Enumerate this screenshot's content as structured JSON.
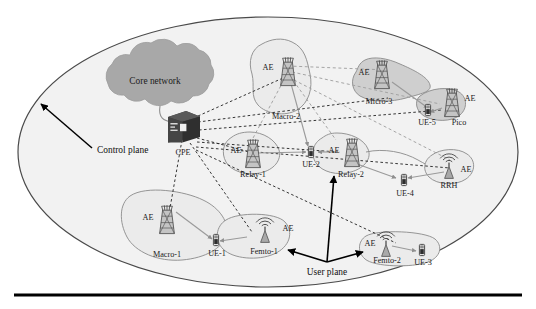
{
  "figure": {
    "colors": {
      "plane_fill": "#f2f2f2",
      "plane_stroke": "#4a4a4a",
      "cloud_fill": "#a8a8a8",
      "cloud_stroke": "#9a9a9a",
      "cell_fill": "#ebebeb",
      "cell_stroke": "#8a8a8a",
      "cell_fill_dark": "#cfcfcf",
      "cpe_fill": "#3c3c3c",
      "tower_fill": "#bdbdbd",
      "tower_stroke": "#555555",
      "link_solid": "#9a9a9a",
      "link_dashed": "#2b2b2b",
      "arrow_black": "#000000",
      "rule": "#000000"
    },
    "cloud": {
      "label": "Core network"
    },
    "cpe": {
      "label": "CPE",
      "icon": "server-box-icon"
    },
    "annotations": [
      {
        "id": "control-plane",
        "label": "Control plane"
      },
      {
        "id": "user-plane",
        "label": "User plane"
      }
    ],
    "ae_label": "AE",
    "cells": [
      {
        "id": "macro-2",
        "label": "Macro-2",
        "ae": "AE",
        "node": "tower-icon",
        "shade": "light"
      },
      {
        "id": "micro-3",
        "label": "Micro-3",
        "ae": "AE",
        "node": "tower-icon",
        "shade": "dark"
      },
      {
        "id": "pico",
        "label": "Pico",
        "ae": "AE",
        "node": "tower-icon",
        "shade": "dark"
      },
      {
        "id": "relay-1",
        "label": "Relay-1",
        "ae": "AE",
        "node": "tower-icon",
        "shade": "light"
      },
      {
        "id": "relay-2",
        "label": "Relay-2",
        "ae": "AE",
        "node": "tower-icon",
        "shade": "light"
      },
      {
        "id": "rrh",
        "label": "RRH",
        "ae": "AE",
        "node": "antenna-icon",
        "shade": "light"
      },
      {
        "id": "macro-1",
        "label": "Macro-1",
        "ae": "AE",
        "node": "tower-icon",
        "shade": "light"
      },
      {
        "id": "femto-1",
        "label": "Femto-1",
        "ae": "AE",
        "node": "antenna-icon",
        "shade": "light"
      },
      {
        "id": "femto-2",
        "label": "Femto-2",
        "ae": "AE",
        "node": "antenna-icon",
        "shade": "light"
      }
    ],
    "user_equipment": [
      {
        "id": "ue-1",
        "label": "UE-1"
      },
      {
        "id": "ue-2",
        "label": "UE-2"
      },
      {
        "id": "ue-3",
        "label": "UE-3"
      },
      {
        "id": "ue-4",
        "label": "UE-4"
      },
      {
        "id": "ue-5",
        "label": "UE-5"
      }
    ]
  }
}
